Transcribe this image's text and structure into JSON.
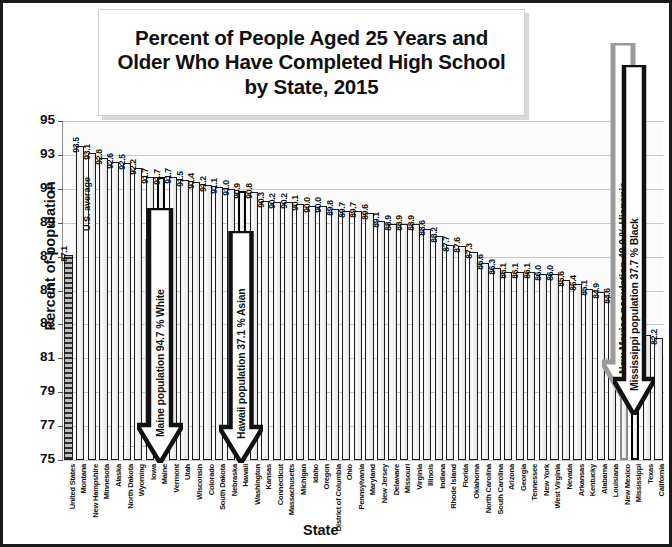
{
  "figure": {
    "title": "Percent of People Aged 25 Years and Older Who Have Completed High School by State, 2015",
    "title_line1": "Percent of People Aged 25 Years and",
    "title_line2": "Older Who Have Completed High School",
    "title_line3": "by State, 2015",
    "ylabel": "Percent of population",
    "xlabel": "State",
    "us_average_note": "U.S. average"
  },
  "annotations": [
    {
      "id": "maine",
      "text": "Maine population 94.7 % White",
      "style": "black",
      "target": "Maine"
    },
    {
      "id": "hawaii",
      "text": "Hawaii population 37.1 % Asian",
      "style": "black",
      "target": "Hawaii"
    },
    {
      "id": "new-mexico",
      "text": "New Mexico population 48.0 % Hispanic",
      "style": "gray",
      "target": "New Mexico"
    },
    {
      "id": "mississippi",
      "text": "Mississippi population 37.7 % Black",
      "style": "black",
      "target": "Mississippi"
    }
  ],
  "colors": {
    "bar_fill": "#f2f2f2",
    "bar_outline": "#1c1c1c",
    "highlight_black": "#000000",
    "highlight_gray": "#8a8a8a",
    "grid": "#c9c9c9",
    "plot_background": "#fbfbfb",
    "frame": "#1a1a1a"
  },
  "chart_data": {
    "type": "bar",
    "title": "Percent of People Aged 25 Years and Older Who Have Completed High School by State, 2015",
    "xlabel": "State",
    "ylabel": "Percent of population",
    "ylim": [
      75,
      95
    ],
    "yticks": [
      75,
      77,
      79,
      81,
      83,
      85,
      87,
      89,
      91,
      93,
      95
    ],
    "grid": true,
    "legend": "none",
    "categories": [
      "United States",
      "Montana",
      "New Hampshire",
      "Minnesota",
      "Alaska",
      "North Dakota",
      "Wyoming",
      "Iowa",
      "Maine",
      "Vermont",
      "Utah",
      "Wisconsin",
      "Colorado",
      "South Dakota",
      "Nebraska",
      "Hawaii",
      "Washington",
      "Kansas",
      "Connecticut",
      "Massachusetts",
      "Michigan",
      "Idaho",
      "Oregon",
      "District of Columbia",
      "Ohio",
      "Pennsylvania",
      "Maryland",
      "New Jersey",
      "Delaware",
      "Missouri",
      "Virginia",
      "Illinois",
      "Indiana",
      "Rhode Island",
      "Florida",
      "Oklahoma",
      "North Carolina",
      "South Carolina",
      "Arizona",
      "Georgia",
      "Tennessee",
      "New York",
      "West Virginia",
      "Nevada",
      "Arkansas",
      "Kentucky",
      "Alabama",
      "Louisiana",
      "New Mexico",
      "Mississippi",
      "Texas",
      "California"
    ],
    "values": [
      87.1,
      93.5,
      93.1,
      92.8,
      92.6,
      92.5,
      92.2,
      91.7,
      91.7,
      91.7,
      91.5,
      91.4,
      91.2,
      91.1,
      91.0,
      90.9,
      90.8,
      90.3,
      90.2,
      90.2,
      90.1,
      90.0,
      90.0,
      89.8,
      89.7,
      89.7,
      89.6,
      89.1,
      88.9,
      88.9,
      88.9,
      88.6,
      88.2,
      87.7,
      87.6,
      87.3,
      86.6,
      86.3,
      86.1,
      86.1,
      86.1,
      86.0,
      86.0,
      85.6,
      85.4,
      85.1,
      84.9,
      84.6,
      84.6,
      83.5,
      82.4,
      82.2
    ],
    "bar_styles": [
      "us",
      "plain",
      "plain",
      "plain",
      "plain",
      "plain",
      "plain",
      "plain",
      "hl-black",
      "plain",
      "plain",
      "plain",
      "plain",
      "plain",
      "plain",
      "hl-black",
      "plain",
      "plain",
      "plain",
      "plain",
      "plain",
      "plain",
      "plain",
      "plain",
      "plain",
      "plain",
      "plain",
      "plain",
      "plain",
      "plain",
      "plain",
      "plain",
      "plain",
      "plain",
      "plain",
      "plain",
      "plain",
      "plain",
      "plain",
      "plain",
      "plain",
      "plain",
      "plain",
      "plain",
      "plain",
      "plain",
      "plain",
      "plain",
      "hl-gray",
      "hl-black",
      "plain",
      "plain"
    ]
  }
}
